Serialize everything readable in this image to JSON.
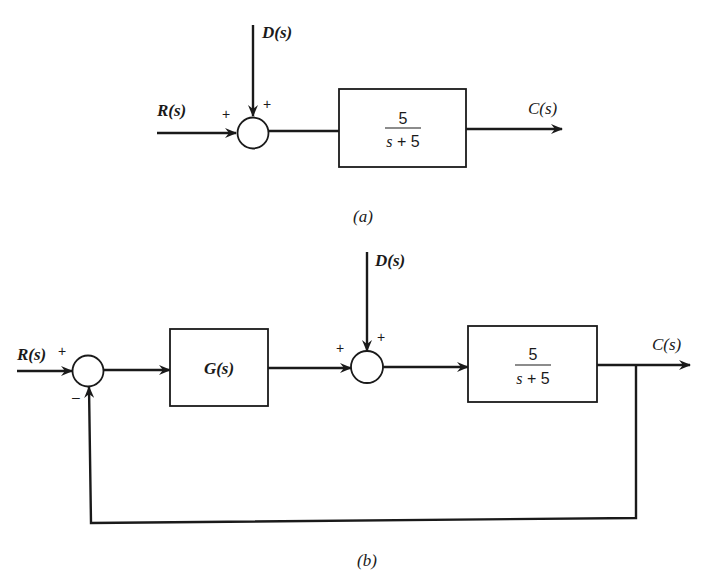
{
  "diagram_a": {
    "caption": "(a)",
    "input_label": "R(s)",
    "disturbance_label": "D(s)",
    "output_label": "C(s)",
    "sum_signs": {
      "input": "+",
      "disturbance": "+"
    },
    "plant": {
      "numerator": "5",
      "denominator_s": "s",
      "denominator_rest": " + 5"
    }
  },
  "diagram_b": {
    "caption": "(b)",
    "input_label": "R(s)",
    "disturbance_label": "D(s)",
    "output_label": "C(s)",
    "sum1_signs": {
      "input": "+",
      "feedback": "–"
    },
    "sum2_signs": {
      "input": "+",
      "disturbance": "+"
    },
    "controller": {
      "label": "G(s)"
    },
    "plant": {
      "numerator": "5",
      "denominator_s": "s",
      "denominator_rest": " + 5"
    }
  }
}
